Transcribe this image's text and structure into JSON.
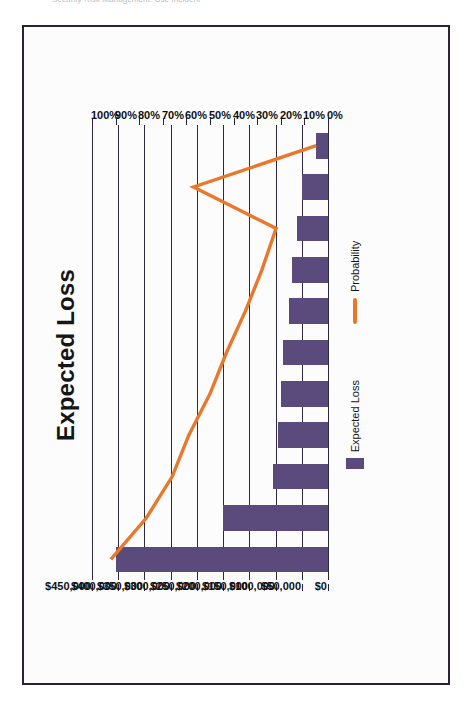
{
  "page": {
    "caption_clipped": "Security Risk Management: Use Incident"
  },
  "figure": {
    "frame_color": "#2b2236",
    "background": "#fcfcfd"
  },
  "chart_data": {
    "type": "bar",
    "title": "Expected Loss",
    "orientation": "horizontal-rotated",
    "categories": [
      "1",
      "2",
      "3",
      "4",
      "5",
      "6",
      "7",
      "8",
      "9",
      "10",
      "11"
    ],
    "series": [
      {
        "name": "Expected Loss",
        "kind": "bar",
        "color": "#5b4b7d",
        "axis": "dollar",
        "values": [
          405000,
          200000,
          105000,
          95000,
          90000,
          85000,
          75000,
          68000,
          60000,
          50000,
          22000
        ]
      },
      {
        "name": "Probability",
        "kind": "line",
        "color": "#e8782b",
        "axis": "percent",
        "values": [
          92,
          77,
          66,
          59,
          50,
          43,
          35,
          28,
          22,
          57,
          5
        ]
      }
    ],
    "axes": {
      "dollar": {
        "label": "",
        "ticks": [
          "$450,000",
          "$400,000",
          "$350,000",
          "$300,000",
          "$250,000",
          "$200,000",
          "$150,000",
          "$100,000",
          "$50,000",
          "$0"
        ],
        "tick_values": [
          450000,
          400000,
          350000,
          300000,
          250000,
          200000,
          150000,
          100000,
          50000,
          0
        ],
        "min": 0,
        "max": 450000,
        "direction": "max-at-left"
      },
      "percent": {
        "label": "",
        "ticks": [
          "100%",
          "90%",
          "80%",
          "70%",
          "60%",
          "50%",
          "40%",
          "30%",
          "20%",
          "10%",
          "0%"
        ],
        "tick_values": [
          100,
          90,
          80,
          70,
          60,
          50,
          40,
          30,
          20,
          10,
          0
        ],
        "min": 0,
        "max": 100,
        "direction": "max-at-left"
      }
    },
    "grid": true,
    "legend": {
      "position": "right",
      "entries": [
        {
          "label": "Expected Loss",
          "type": "bar",
          "color": "#5b4b7d"
        },
        {
          "label": "Probability",
          "type": "line",
          "color": "#e8782b"
        }
      ]
    },
    "xlabel": "",
    "ylabel": "",
    "ylim": [
      0,
      450000
    ]
  }
}
